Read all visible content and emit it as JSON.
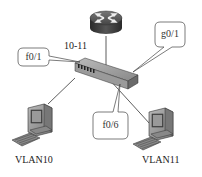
{
  "diagram": {
    "type": "network-topology",
    "nodes": {
      "router": {
        "icon": "router-icon"
      },
      "switch": {
        "icon": "switch-icon",
        "label": "10-11"
      },
      "pc_left": {
        "icon": "computer-icon",
        "label": "VLAN10"
      },
      "pc_right": {
        "icon": "computer-icon",
        "label": "VLAN11"
      }
    },
    "callouts": {
      "f01": "f0/1",
      "g01": "g0/1",
      "f06": "f0/6"
    },
    "colors": {
      "line": "#333333",
      "device_dark": "#3a3a3a",
      "device_mid": "#8a8a8a",
      "device_light": "#cfcfcf",
      "callout_border": "#444444"
    }
  }
}
